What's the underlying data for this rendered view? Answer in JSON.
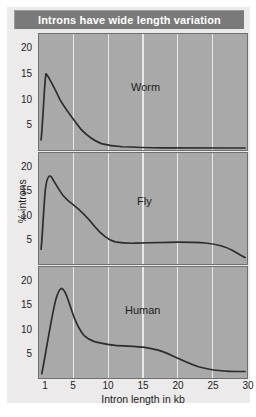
{
  "title": "Introns have wide length variation",
  "axes": {
    "xlabel": "Intron length in kb",
    "ylabel": "% introns",
    "xticks": [
      "1",
      "5",
      "10",
      "15",
      "20",
      "25",
      "30"
    ],
    "yticks": [
      "20",
      "15",
      "10",
      "5"
    ]
  },
  "panels": [
    {
      "label": "Worm"
    },
    {
      "label": "Fly"
    },
    {
      "label": "Human"
    }
  ],
  "colors": {
    "title_bar": "#7a7a7a",
    "title_text": "#ffffff",
    "panel_background": "#a9a9a9",
    "gridline": "#e8e8e8",
    "curve": "#2c2c2c",
    "card_background": "#eceaea"
  },
  "chart_data": {
    "type": "line",
    "title": "Introns have wide length variation",
    "xlabel": "Intron length in kb",
    "ylabel": "% introns",
    "xlim": [
      0,
      30
    ],
    "ylim": [
      0,
      23
    ],
    "xticks": [
      1,
      5,
      10,
      15,
      20,
      25,
      30
    ],
    "yticks": [
      5,
      10,
      15,
      20
    ],
    "grid": "vertical-only",
    "legend": "none",
    "panel_layout": "3 stacked subplots sharing x-axis",
    "annotations": [
      "Worm",
      "Fly",
      "Human"
    ],
    "series": [
      {
        "name": "Worm",
        "panel": 1,
        "x": [
          0.3,
          0.5,
          0.8,
          1.0,
          1.3,
          1.6,
          2.0,
          2.5,
          3.0,
          4.0,
          5.0,
          6.0,
          7.0,
          8.0,
          9.0,
          10.0,
          11.0,
          12.0,
          13.0,
          14.0,
          15.0,
          17.0,
          20.0,
          23.0,
          26.0,
          28.0,
          30.0
        ],
        "y": [
          2.0,
          11.0,
          19.0,
          20.5,
          20.2,
          19.4,
          18.2,
          16.6,
          15.2,
          12.6,
          10.4,
          8.6,
          7.0,
          5.6,
          4.4,
          3.6,
          3.0,
          2.7,
          2.5,
          2.4,
          2.3,
          2.2,
          2.1,
          2.1,
          2.1,
          2.1,
          2.1
        ]
      },
      {
        "name": "Fly",
        "panel": 2,
        "x": [
          0.3,
          0.6,
          0.9,
          1.2,
          1.5,
          2.0,
          2.5,
          3.0,
          3.5,
          4.0,
          5.0,
          6.0,
          7.0,
          8.0,
          9.0,
          10.0,
          11.0,
          12.0,
          14.0,
          16.0,
          19.0,
          22.0,
          25.0,
          27.0,
          29.0,
          30.0
        ],
        "y": [
          3.0,
          13.5,
          20.0,
          21.3,
          21.5,
          20.3,
          18.6,
          17.0,
          15.9,
          15.0,
          13.4,
          11.6,
          9.6,
          7.6,
          6.0,
          5.0,
          4.6,
          4.4,
          4.5,
          4.6,
          4.8,
          4.8,
          4.7,
          4.5,
          4.0,
          3.4
        ]
      },
      {
        "name": "Human",
        "panel": 3,
        "x": [
          0.4,
          0.8,
          1.2,
          1.6,
          2.0,
          2.5,
          3.0,
          3.5,
          4.0,
          4.5,
          5.0,
          6.0,
          7.0,
          8.0,
          9.0,
          10.0,
          11.0,
          12.0,
          13.0,
          15.0,
          17.0,
          19.0,
          21.0,
          23.0,
          25.0,
          27.0,
          29.0,
          30.0
        ],
        "y": [
          1.5,
          5.0,
          9.5,
          14.5,
          18.0,
          20.6,
          21.1,
          20.4,
          18.8,
          17.0,
          15.2,
          12.6,
          11.0,
          10.0,
          9.4,
          9.0,
          8.7,
          8.5,
          8.4,
          8.1,
          7.5,
          6.7,
          5.9,
          5.1,
          4.5,
          4.1,
          3.9,
          3.9
        ]
      }
    ]
  }
}
